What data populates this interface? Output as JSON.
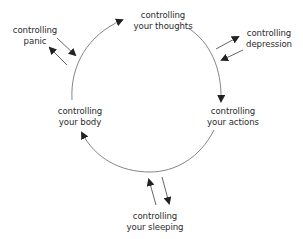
{
  "diagram": {
    "type": "cycle",
    "colors": {
      "line": "#777777",
      "arrow": "#222222",
      "text": "#2b2b2b",
      "background": "#ffffff"
    },
    "cycle_nodes": [
      {
        "id": "thoughts",
        "line1": "controlling",
        "line2": "your thoughts"
      },
      {
        "id": "actions",
        "line1": "controlling",
        "line2": "your actions"
      },
      {
        "id": "body",
        "line1": "controlling",
        "line2": "your body"
      }
    ],
    "satellite_nodes": [
      {
        "id": "depression",
        "line1": "controlling",
        "line2": "depression",
        "connects_to": "thoughts-actions arc"
      },
      {
        "id": "panic",
        "line1": "controlling",
        "line2": "panic",
        "connects_to": "body-thoughts arc"
      },
      {
        "id": "sleeping",
        "line1": "controlling",
        "line2": "your sleeping",
        "connects_to": "actions-body arc"
      }
    ],
    "cycle_direction": "clockwise: thoughts → actions → body → thoughts",
    "satellite_links": "bidirectional arrows"
  }
}
